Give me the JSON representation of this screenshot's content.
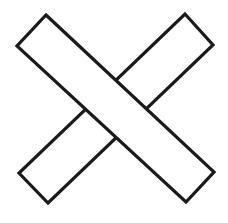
{
  "figure": {
    "title": "X Cross Outline",
    "shape_name": "x-cross",
    "canvas": {
      "width": 228,
      "height": 223,
      "background_color": "#ffffff"
    },
    "style": {
      "stroke_color": "#1a1a1a",
      "stroke_width": 3.2,
      "fill_color": "#ffffff",
      "line_join": "miter",
      "line_cap": "butt"
    },
    "bars": [
      {
        "name": "descending-bar",
        "label": "Bar from upper-left to lower-right",
        "z_order": 2,
        "in_front": true,
        "corners": [
          {
            "label": "top-vertex",
            "x": 46,
            "y": 15
          },
          {
            "label": "right-vertex",
            "x": 214,
            "y": 172
          },
          {
            "label": "bottom-vertex",
            "x": 186,
            "y": 202
          },
          {
            "label": "left-vertex",
            "x": 17,
            "y": 46
          }
        ],
        "points": "46,15 214,172 186,202 17,46",
        "bar_width_px": 41,
        "angle_deg": 43
      },
      {
        "name": "ascending-bar",
        "label": "Bar from lower-left to upper-right",
        "z_order": 1,
        "in_front": false,
        "corners": [
          {
            "label": "top-vertex",
            "x": 185,
            "y": 14
          },
          {
            "label": "right-vertex",
            "x": 213,
            "y": 45
          },
          {
            "label": "bottom-vertex",
            "x": 48,
            "y": 203
          },
          {
            "label": "left-vertex",
            "x": 19,
            "y": 173
          }
        ],
        "points": "185,14 213,45 48,203 19,173",
        "bar_width_px": 41,
        "angle_deg": -48
      }
    ],
    "intersection": {
      "center_x": 114,
      "center_y": 110,
      "junction_count": 4,
      "junction_type": "t-junction",
      "note": "Edges of the ascending bar terminate where they meet the descending bar outline."
    }
  }
}
